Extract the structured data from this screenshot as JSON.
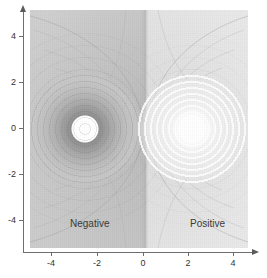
{
  "chart_data": {
    "type": "heatmap",
    "title": "",
    "subtitle": "",
    "xlabel": "",
    "ylabel": "",
    "xlim": [
      -5,
      5
    ],
    "ylim": [
      -5,
      5
    ],
    "xticks": [
      -4,
      -2,
      0,
      2,
      4
    ],
    "yticks": [
      -4,
      -2,
      0,
      2,
      4
    ],
    "xtick_labels": [
      "-4",
      "-2",
      "0",
      "2",
      "4"
    ],
    "ytick_labels": [
      "-4",
      "-2",
      "0",
      "2",
      "4"
    ],
    "grid": false,
    "legend": "none",
    "colormap": "grayscale",
    "annotations": [
      {
        "text": "Negative",
        "x": -2.5,
        "y": -3.6
      },
      {
        "text": "Positive",
        "x": 2.6,
        "y": -3.6
      }
    ],
    "features": [
      {
        "name": "negative-charge",
        "label": "Negative",
        "center_x": -2.5,
        "center_y": 0.0,
        "sign": "negative",
        "core_fill": "#ffffff",
        "halo_shade": "dark",
        "ring_count": 9
      },
      {
        "name": "positive-charge",
        "label": "Positive",
        "center_x": 2.7,
        "center_y": 0.0,
        "sign": "positive",
        "core_fill": "#ffffff",
        "halo_shade": "bright",
        "ring_count": 9
      }
    ],
    "zero_potential_plane_x": 0,
    "background_left_color": "#cbcbcb",
    "background_right_color": "#e8e8e8"
  },
  "axes": {
    "x": {
      "ticks": [
        {
          "label": "-4",
          "value": -4,
          "px": 51
        },
        {
          "label": "-2",
          "value": -2,
          "px": 97
        },
        {
          "label": "0",
          "value": 0,
          "px": 143
        },
        {
          "label": "2",
          "value": 2,
          "px": 188
        },
        {
          "label": "4",
          "value": 4,
          "px": 233
        }
      ],
      "arrow": "arrow-right-icon"
    },
    "y": {
      "ticks": [
        {
          "label": "4",
          "value": 4,
          "px": 36
        },
        {
          "label": "2",
          "value": 2,
          "px": 82
        },
        {
          "label": "0",
          "value": 0,
          "px": 128
        },
        {
          "label": "-2",
          "value": -2,
          "px": 174
        },
        {
          "label": "-4",
          "value": -4,
          "px": 220
        }
      ],
      "arrow": "arrow-up-icon"
    }
  },
  "labels": {
    "negative": "Negative",
    "positive": "Positive"
  },
  "colors": {
    "axis": "#6e6e6e",
    "tick_text": "#333333",
    "label_text": "#3a3a3a",
    "contour_line": "#9e9e9e",
    "plot_background": "#ffffff"
  }
}
